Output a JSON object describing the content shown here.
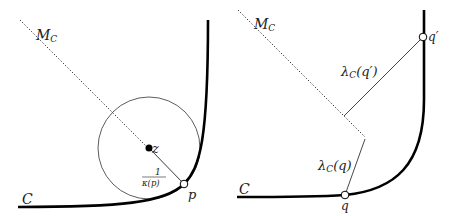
{
  "figure": {
    "left_panel": {
      "curve_label": "C",
      "medial_axis_label": "M",
      "medial_axis_sub": "C",
      "center_label": "z",
      "point_label": "p",
      "radius_label_num": "1",
      "radius_label_den": "κ(p)"
    },
    "right_panel": {
      "curve_label": "C",
      "medial_axis_label": "M",
      "medial_axis_sub": "C",
      "point_q_label": "q",
      "point_q_prime_label": "q′",
      "lambda_q_main": "λ",
      "lambda_q_sub": "C",
      "lambda_q_arg": "(q)",
      "lambda_qp_main": "λ",
      "lambda_qp_sub": "C",
      "lambda_qp_arg": "(q′)"
    },
    "colors": {
      "stroke": "#111111",
      "background": "#ffffff"
    }
  }
}
